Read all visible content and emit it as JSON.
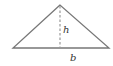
{
  "diagram": {
    "shape": "triangle",
    "labels": {
      "height": "h",
      "base": "b"
    },
    "colors": {
      "stroke": "#777777",
      "label": "#333333",
      "background": "#ffffff"
    },
    "geometry": {
      "apex": [
        60,
        5
      ],
      "base_left": [
        13,
        48
      ],
      "base_right": [
        109,
        48
      ]
    }
  }
}
